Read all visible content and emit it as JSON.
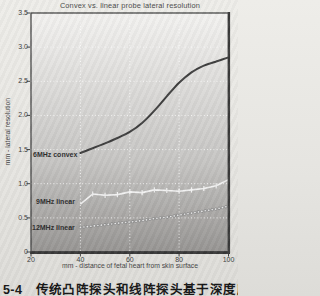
{
  "page": {
    "caption": "5-4　传统凸阵探头和线阵探头基于深度所量"
  },
  "chart_data": {
    "type": "line",
    "title": "Convex vs. linear probe lateral resolution",
    "xlabel": "mm - distance of fetal heart from skin surface",
    "ylabel": "mm - lateral resolution",
    "xlim": [
      20,
      100
    ],
    "ylim": [
      0,
      3.5
    ],
    "x_ticks": [
      20,
      40,
      60,
      80,
      100
    ],
    "y_ticks": [
      0,
      0.5,
      1.0,
      1.5,
      2.0,
      2.5,
      3.0,
      3.5
    ],
    "y_tick_labels": [
      "0",
      "0.5",
      "1.0",
      "1.5",
      "2.0",
      "2.5",
      "3.0",
      "3.5"
    ],
    "grid": "dotted white lines at each interior tick",
    "legend_position": "labels beside curves inside plot",
    "x": [
      40,
      45,
      50,
      55,
      60,
      65,
      70,
      75,
      80,
      85,
      90,
      95,
      100
    ],
    "series": [
      {
        "name": "6MHz convex",
        "style": "smooth solid dark curve",
        "color": "#3f3f3f",
        "values": [
          1.45,
          1.52,
          1.59,
          1.67,
          1.76,
          1.89,
          2.07,
          2.28,
          2.48,
          2.63,
          2.73,
          2.79,
          2.85
        ]
      },
      {
        "name": "9MHz linear",
        "style": "jagged white line with vertical tick markers",
        "color": "#f2f2f2",
        "values": [
          0.7,
          0.85,
          0.83,
          0.84,
          0.88,
          0.87,
          0.91,
          0.9,
          0.89,
          0.91,
          0.93,
          0.97,
          1.06
        ]
      },
      {
        "name": "12MHz linear",
        "style": "dotted light line of small circles",
        "color": "#e6e6e6",
        "values": [
          0.36,
          0.38,
          0.4,
          0.42,
          0.44,
          0.46,
          0.49,
          0.51,
          0.54,
          0.57,
          0.6,
          0.63,
          0.67
        ]
      }
    ],
    "colors": {
      "plot_bg_top": "#f3f2f0",
      "plot_bg_mid": "#c6c5c3",
      "plot_bg_bottom": "#979593",
      "plot_border": "#454545",
      "grid": "#ffffff",
      "axis_text": "#3d3d3d",
      "dotted_series_ring": "#8f8f8f"
    }
  }
}
